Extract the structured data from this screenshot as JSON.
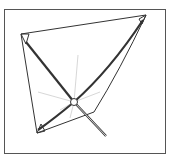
{
  "illustration": {
    "subject": "shade sail frame with crossed poles",
    "stroke_color": "#333333",
    "frame_color": "#555555"
  }
}
